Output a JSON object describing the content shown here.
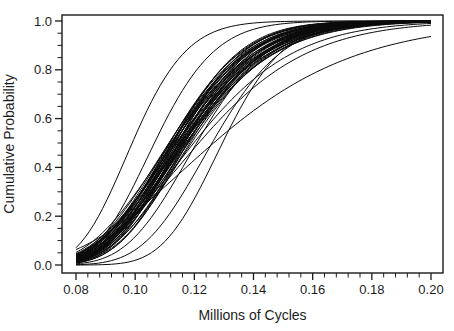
{
  "figure": {
    "background": "#ffffff",
    "curve_color": "#0a0a0a",
    "frame_color": "#1a1a1a",
    "text_color": "#1c1c1c"
  },
  "chart_data": {
    "type": "line",
    "title": "",
    "xlabel": "Millions of Cycles",
    "ylabel": "Cumulative Probability",
    "xlim": [
      0.08,
      0.2
    ],
    "ylim": [
      0.0,
      1.0
    ],
    "x_major_ticks": [
      0.08,
      0.1,
      0.12,
      0.14,
      0.16,
      0.18,
      0.2
    ],
    "x_tick_labels": [
      "0.08",
      "0.10",
      "0.12",
      "0.14",
      "0.16",
      "0.18",
      "0.20"
    ],
    "x_minor_step": 0.004,
    "y_major_ticks": [
      0.0,
      0.2,
      0.4,
      0.6,
      0.8,
      1.0
    ],
    "y_tick_labels": [
      "0.0",
      "0.2",
      "0.4",
      "0.6",
      "0.8",
      "1.0"
    ],
    "y_minor_step": 0.05,
    "grid": false,
    "legend": null,
    "curve_model": "lognormal_cdf",
    "n_curves": 50,
    "curves": [
      {
        "median": 0.1148,
        "sigma": 0.178
      },
      {
        "median": 0.1162,
        "sigma": 0.192
      },
      {
        "median": 0.1135,
        "sigma": 0.168
      },
      {
        "median": 0.1171,
        "sigma": 0.205
      },
      {
        "median": 0.1122,
        "sigma": 0.182
      },
      {
        "median": 0.1155,
        "sigma": 0.163
      },
      {
        "median": 0.118,
        "sigma": 0.196
      },
      {
        "median": 0.114,
        "sigma": 0.21
      },
      {
        "median": 0.1128,
        "sigma": 0.158
      },
      {
        "median": 0.1166,
        "sigma": 0.186
      },
      {
        "median": 0.1152,
        "sigma": 0.201
      },
      {
        "median": 0.1117,
        "sigma": 0.172
      },
      {
        "median": 0.1174,
        "sigma": 0.183
      },
      {
        "median": 0.1146,
        "sigma": 0.153
      },
      {
        "median": 0.1131,
        "sigma": 0.197
      },
      {
        "median": 0.1159,
        "sigma": 0.214
      },
      {
        "median": 0.1185,
        "sigma": 0.171
      },
      {
        "median": 0.1125,
        "sigma": 0.187
      },
      {
        "median": 0.115,
        "sigma": 0.166
      },
      {
        "median": 0.1168,
        "sigma": 0.157
      },
      {
        "median": 0.1138,
        "sigma": 0.202
      },
      {
        "median": 0.1156,
        "sigma": 0.177
      },
      {
        "median": 0.1114,
        "sigma": 0.191
      },
      {
        "median": 0.1177,
        "sigma": 0.162
      },
      {
        "median": 0.1143,
        "sigma": 0.188
      },
      {
        "median": 0.112,
        "sigma": 0.206
      },
      {
        "median": 0.1163,
        "sigma": 0.173
      },
      {
        "median": 0.119,
        "sigma": 0.184
      },
      {
        "median": 0.1133,
        "sigma": 0.176
      },
      {
        "median": 0.1153,
        "sigma": 0.193
      },
      {
        "median": 0.099,
        "sigma": 0.145
      },
      {
        "median": 0.1065,
        "sigma": 0.15
      },
      {
        "median": 0.1295,
        "sigma": 0.125
      },
      {
        "median": 0.1215,
        "sigma": 0.235
      },
      {
        "median": 0.1265,
        "sigma": 0.3
      },
      {
        "median": 0.126,
        "sigma": 0.15
      },
      {
        "median": 0.1172,
        "sigma": 0.196
      },
      {
        "median": 0.1126,
        "sigma": 0.178
      },
      {
        "median": 0.1158,
        "sigma": 0.187
      },
      {
        "median": 0.1136,
        "sigma": 0.161
      },
      {
        "median": 0.1198,
        "sigma": 0.22
      },
      {
        "median": 0.1115,
        "sigma": 0.181
      },
      {
        "median": 0.1165,
        "sigma": 0.199
      },
      {
        "median": 0.1142,
        "sigma": 0.169
      },
      {
        "median": 0.113,
        "sigma": 0.192
      },
      {
        "median": 0.1178,
        "sigma": 0.174
      },
      {
        "median": 0.115,
        "sigma": 0.209
      },
      {
        "median": 0.1124,
        "sigma": 0.164
      },
      {
        "median": 0.1161,
        "sigma": 0.179
      },
      {
        "median": 0.1208,
        "sigma": 0.158
      }
    ]
  }
}
